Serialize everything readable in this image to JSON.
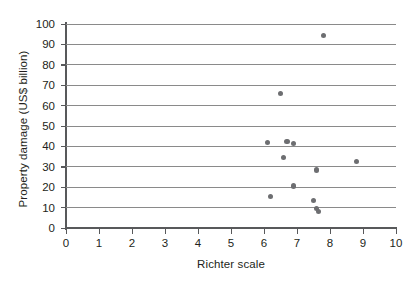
{
  "chart_data": {
    "type": "scatter",
    "title": "",
    "xlabel": "Richter scale",
    "ylabel": "Property damage (US$ billion)",
    "xlim": [
      0,
      10
    ],
    "ylim": [
      0,
      100
    ],
    "xticks": [
      0,
      1,
      2,
      3,
      4,
      5,
      6,
      7,
      8,
      9,
      10
    ],
    "yticks": [
      0,
      10,
      20,
      30,
      40,
      50,
      60,
      70,
      80,
      90,
      100
    ],
    "xtick_labels": [
      "0",
      "1",
      "2",
      "3",
      "4",
      "5",
      "6",
      "7",
      "8",
      "9",
      "10"
    ],
    "ytick_labels": [
      "0",
      "10",
      "20",
      "30",
      "40",
      "50",
      "60",
      "70",
      "80",
      "90",
      "100"
    ],
    "grid": "horizontal",
    "legend": "none",
    "marker_color": "#6d6e71",
    "gridline_color": "#8a8a8a",
    "axis_color": "#58595b",
    "points": [
      {
        "x": 7.8,
        "y": 94.5
      },
      {
        "x": 6.5,
        "y": 66.0
      },
      {
        "x": 6.7,
        "y": 42.5
      },
      {
        "x": 6.1,
        "y": 42.0
      },
      {
        "x": 6.9,
        "y": 41.5
      },
      {
        "x": 6.6,
        "y": 34.5
      },
      {
        "x": 8.8,
        "y": 32.5
      },
      {
        "x": 7.6,
        "y": 28.5
      },
      {
        "x": 6.9,
        "y": 20.5
      },
      {
        "x": 6.2,
        "y": 15.5
      },
      {
        "x": 7.5,
        "y": 13.5
      },
      {
        "x": 7.6,
        "y": 9.5
      },
      {
        "x": 7.65,
        "y": 8.0
      }
    ]
  }
}
